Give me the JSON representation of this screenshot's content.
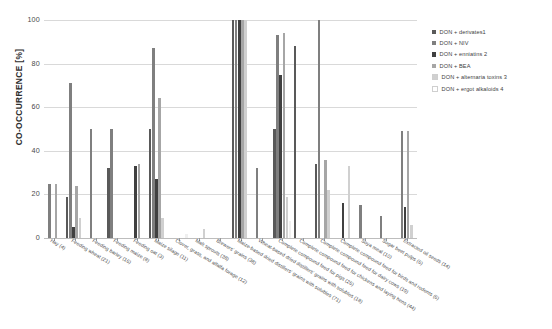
{
  "chart_data": {
    "type": "bar",
    "title": "",
    "subtitle": "",
    "xlabel": "",
    "ylabel": "CO-OCCURRENCE [%]",
    "ylim": [
      0,
      100
    ],
    "yticks": [
      0,
      20,
      40,
      60,
      80,
      100
    ],
    "ytick_labels": [
      "0",
      "20",
      "40",
      "60",
      "80",
      "100"
    ],
    "grid": true,
    "legend_position": "top-right",
    "categories": [
      "Hay (4)",
      "Feeding wheat (21)",
      "Feeding barley (16)",
      "Feeding maize (8)",
      "Feeding oat (3)",
      "Maize silage (11)",
      "Clover, grass, and alfalfa forage (12)",
      "Malt sprouts (38)",
      "Brewers' grains (38)",
      "Maize-based dried distillers' grains with solubles (71)",
      "Wheat-based dried distillers' grains with solubles (18)",
      "Complete compound feed for pigs (26)",
      "Complete compound feed for chickens and laying hens (44)",
      "Complete compound feed for dairy cows (19)",
      "Complete compound feed for birds and rodents (6)",
      "Soya meal (10)",
      "Sugar beet pulps (6)",
      "Extracted oil seeds (14)"
    ],
    "series": [
      {
        "name": "DON + derivates1",
        "color": "#595959",
        "values": [
          0,
          19,
          0,
          32,
          0,
          50,
          0,
          0,
          0,
          100,
          0,
          50,
          88,
          34,
          0,
          0,
          0,
          0
        ]
      },
      {
        "name": "DON + NIV",
        "color": "#7f7f7f",
        "values": [
          25,
          71,
          50,
          50,
          0,
          87,
          0,
          0,
          0,
          100,
          32,
          93,
          0,
          100,
          0,
          15,
          10,
          49
        ]
      },
      {
        "name": "DON + enniatins 2",
        "color": "#404040",
        "values": [
          0,
          5,
          0,
          0,
          33,
          27,
          0,
          0,
          0,
          100,
          0,
          75,
          0,
          0,
          16,
          0,
          0,
          14
        ]
      },
      {
        "name": "DON + BEA",
        "color": "#a6a6a6",
        "values": [
          25,
          24,
          0,
          0,
          34,
          64,
          0,
          0,
          0,
          100,
          0,
          94,
          0,
          36,
          0,
          0,
          0,
          49
        ]
      },
      {
        "name": "DON + alternaria toxins 3",
        "color": "#d0d0d0",
        "values": [
          0,
          9,
          0,
          0,
          0,
          9,
          0,
          4,
          0,
          100,
          0,
          19,
          0,
          22,
          33,
          0,
          0,
          6
        ]
      },
      {
        "name": "DON + ergot alkaloids 4",
        "color": "#efefef",
        "values": [
          0,
          0,
          0,
          0,
          0,
          0,
          2,
          0,
          0,
          0,
          0,
          8,
          0,
          0,
          0,
          0,
          0,
          0
        ]
      }
    ]
  },
  "legend": {
    "items": [
      {
        "label": "DON + derivates1",
        "color": "#595959"
      },
      {
        "label": "DON + NIV",
        "color": "#7f7f7f"
      },
      {
        "label": "DON + enniatins 2",
        "color": "#404040"
      },
      {
        "label": "DON + BEA",
        "color": "#a6a6a6"
      },
      {
        "label": "DON + alternaria toxins 3",
        "color": "#d0d0d0"
      },
      {
        "label": "DON + ergot alkaloids 4",
        "color": "#efefef"
      }
    ]
  },
  "axis": {
    "y_title": "CO-OCCURRENCE [%]"
  }
}
